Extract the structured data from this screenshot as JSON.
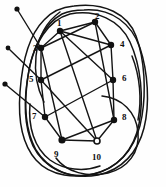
{
  "figure": {
    "kind": "graph-diagram",
    "ink_color": "#141414",
    "background_color": "#fefefe",
    "node_fill": "#111111",
    "width": 166,
    "height": 187
  },
  "nodes": [
    {
      "id": "n1",
      "label": "1",
      "x": 60,
      "y": 31,
      "label_x": 57,
      "label_y": 19
    },
    {
      "id": "n2",
      "label": "2",
      "x": 95,
      "y": 22,
      "label_x": 95,
      "label_y": 12
    },
    {
      "id": "n3",
      "label": "3",
      "x": 41,
      "y": 48,
      "label_x": 33,
      "label_y": 44
    },
    {
      "id": "n4",
      "label": "4",
      "x": 111,
      "y": 45,
      "label_x": 120,
      "label_y": 40
    },
    {
      "id": "n5",
      "label": "5",
      "x": 41,
      "y": 80,
      "label_x": 29,
      "label_y": 75
    },
    {
      "id": "n6",
      "label": "6",
      "x": 113,
      "y": 80,
      "label_x": 122,
      "label_y": 74
    },
    {
      "id": "n7",
      "label": "7",
      "x": 45,
      "y": 117,
      "label_x": 32,
      "label_y": 112
    },
    {
      "id": "n8",
      "label": "8",
      "x": 114,
      "y": 120,
      "label_x": 122,
      "label_y": 113
    },
    {
      "id": "n9",
      "label": "9",
      "x": 62,
      "y": 140,
      "label_x": 54,
      "label_y": 150
    },
    {
      "id": "n10",
      "label": "10",
      "x": 97,
      "y": 141,
      "label_x": 92,
      "label_y": 153
    }
  ],
  "pendant_endpoints": [
    {
      "id": "p1",
      "x": 17,
      "y": 9,
      "connects_to": "n3"
    },
    {
      "id": "p2",
      "x": 8,
      "y": 48,
      "connects_to": "n5"
    },
    {
      "id": "p3",
      "x": 5,
      "y": 84,
      "connects_to": "n7"
    }
  ],
  "lattice_edges": [
    {
      "from": "p1",
      "to": "n3"
    },
    {
      "from": "p2",
      "to": "n5"
    },
    {
      "from": "p3",
      "to": "n7"
    },
    {
      "from": "n1",
      "to": "n3"
    },
    {
      "from": "n1",
      "to": "n2"
    },
    {
      "from": "n1",
      "to": "n4"
    },
    {
      "from": "n2",
      "to": "n4"
    },
    {
      "from": "n3",
      "to": "n5"
    },
    {
      "from": "n5",
      "to": "n7"
    },
    {
      "from": "n4",
      "to": "n6"
    },
    {
      "from": "n6",
      "to": "n8"
    },
    {
      "from": "n7",
      "to": "n9"
    },
    {
      "from": "n9",
      "to": "n10"
    },
    {
      "from": "n8",
      "to": "n10"
    },
    {
      "from": "n3",
      "to": "n9"
    },
    {
      "from": "n5",
      "to": "n10"
    },
    {
      "from": "n2",
      "to": "n8"
    },
    {
      "from": "n1",
      "to": "n6"
    }
  ],
  "outer_loops": {
    "count": 4,
    "description": "Overlapping elongated closed curves forming a braided boundary"
  }
}
